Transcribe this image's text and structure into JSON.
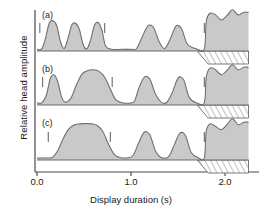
{
  "chart_data": {
    "type": "area",
    "title": "",
    "subtitle": "",
    "xlabel": "Display duration (s)",
    "ylabel": "Relative head amplitude",
    "xlim": [
      -0.02,
      2.25
    ],
    "ylim": [
      0,
      1
    ],
    "grid": false,
    "legend": null,
    "xticks": [
      {
        "value": 0.0,
        "label": "0.0"
      },
      {
        "value": 1.0,
        "label": "1.0"
      },
      {
        "value": 2.0,
        "label": "2.0"
      }
    ],
    "yticks": [],
    "panels": [
      {
        "id": "a",
        "label": "(a)",
        "baseline": 0.0,
        "markers": [
          0.03,
          0.72,
          1.78
        ],
        "hatch_start": 1.8,
        "hatch_end": 2.25,
        "series": [
          {
            "name": "head amplitude (a)",
            "x": [
              0.0,
              0.05,
              0.09,
              0.13,
              0.17,
              0.21,
              0.25,
              0.29,
              0.33,
              0.37,
              0.41,
              0.45,
              0.49,
              0.53,
              0.57,
              0.61,
              0.65,
              0.69,
              0.73,
              0.8,
              0.9,
              1.0,
              1.06,
              1.12,
              1.18,
              1.24,
              1.3,
              1.36,
              1.42,
              1.48,
              1.54,
              1.6,
              1.7,
              1.78,
              1.8,
              1.84,
              1.9,
              1.96,
              2.02,
              2.08,
              2.14,
              2.2,
              2.25
            ],
            "y": [
              0.04,
              0.05,
              0.3,
              0.66,
              0.72,
              0.6,
              0.22,
              0.06,
              0.3,
              0.62,
              0.66,
              0.52,
              0.16,
              0.05,
              0.26,
              0.6,
              0.68,
              0.5,
              0.12,
              0.04,
              0.04,
              0.04,
              0.06,
              0.34,
              0.6,
              0.56,
              0.22,
              0.06,
              0.3,
              0.6,
              0.52,
              0.16,
              0.05,
              0.05,
              0.7,
              0.9,
              0.86,
              0.74,
              0.84,
              0.98,
              0.86,
              0.92,
              0.92
            ]
          }
        ]
      },
      {
        "id": "b",
        "label": "(b)",
        "baseline": 0.0,
        "markers": [
          0.06,
          0.8,
          1.78
        ],
        "hatch_start": 1.8,
        "hatch_end": 2.25,
        "series": [
          {
            "name": "head amplitude (b)",
            "x": [
              0.0,
              0.05,
              0.1,
              0.14,
              0.18,
              0.22,
              0.26,
              0.3,
              0.36,
              0.42,
              0.48,
              0.54,
              0.6,
              0.66,
              0.72,
              0.78,
              0.84,
              0.92,
              1.0,
              1.04,
              1.08,
              1.14,
              1.2,
              1.26,
              1.32,
              1.38,
              1.44,
              1.5,
              1.56,
              1.62,
              1.7,
              1.78,
              1.8,
              1.84,
              1.9,
              1.96,
              2.02,
              2.08,
              2.14,
              2.2,
              2.25
            ],
            "y": [
              0.05,
              0.05,
              0.24,
              0.62,
              0.72,
              0.56,
              0.2,
              0.07,
              0.16,
              0.48,
              0.74,
              0.82,
              0.84,
              0.8,
              0.66,
              0.38,
              0.12,
              0.05,
              0.05,
              0.1,
              0.38,
              0.66,
              0.62,
              0.26,
              0.07,
              0.06,
              0.3,
              0.64,
              0.6,
              0.18,
              0.05,
              0.05,
              0.66,
              0.88,
              0.84,
              0.72,
              0.82,
              0.96,
              0.84,
              0.9,
              0.9
            ]
          }
        ]
      },
      {
        "id": "c",
        "label": "(c)",
        "baseline": 0.0,
        "markers": [
          0.12,
          0.78,
          1.78
        ],
        "hatch_start": 1.8,
        "hatch_end": 2.25,
        "series": [
          {
            "name": "head amplitude (c)",
            "x": [
              0.0,
              0.08,
              0.16,
              0.22,
              0.28,
              0.34,
              0.4,
              0.46,
              0.52,
              0.58,
              0.64,
              0.7,
              0.76,
              0.82,
              0.88,
              0.96,
              1.02,
              1.08,
              1.14,
              1.2,
              1.26,
              1.32,
              1.4,
              1.46,
              1.52,
              1.58,
              1.64,
              1.72,
              1.78,
              1.8,
              1.84,
              1.9,
              1.96,
              2.02,
              2.08,
              2.14,
              2.2,
              2.25
            ],
            "y": [
              0.05,
              0.05,
              0.06,
              0.22,
              0.52,
              0.74,
              0.84,
              0.86,
              0.87,
              0.86,
              0.82,
              0.68,
              0.38,
              0.14,
              0.06,
              0.05,
              0.1,
              0.4,
              0.66,
              0.6,
              0.22,
              0.06,
              0.08,
              0.36,
              0.64,
              0.58,
              0.18,
              0.05,
              0.05,
              0.68,
              0.86,
              0.8,
              0.72,
              0.84,
              0.98,
              0.84,
              0.9,
              0.9
            ]
          }
        ]
      }
    ],
    "colors": {
      "fill": "#c9c9c9",
      "stroke": "#6b6b6b",
      "axis": "#4a4a4a",
      "hatch": "#777777",
      "background": "#ffffff"
    }
  },
  "axes": {
    "y_label": "Relative head amplitude",
    "x_label": "Display duration (s)",
    "x_tick_labels": [
      "0.0",
      "1.0",
      "2.0"
    ]
  },
  "panel_labels": {
    "a": "(a)",
    "b": "(b)",
    "c": "(c)"
  }
}
